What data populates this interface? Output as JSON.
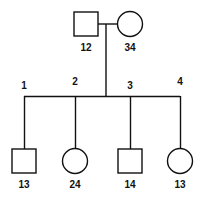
{
  "diagram": {
    "type": "pedigree-chart",
    "title": "",
    "background_color": "#ffffff",
    "line_color": "#111111",
    "shape_fill": "#ffffff",
    "label_color": "#111111"
  },
  "generations": [
    {
      "name": "parents",
      "members": [
        {
          "id": "father",
          "symbol": "square",
          "sex": "male",
          "label": "12",
          "cx": 86,
          "cy": 24,
          "size": 24
        },
        {
          "id": "mother",
          "symbol": "circle",
          "sex": "female",
          "label": "34",
          "cx": 130,
          "cy": 24,
          "size": 24
        }
      ]
    },
    {
      "name": "children",
      "members": [
        {
          "id": "child-1",
          "symbol": "square",
          "sex": "male",
          "label": "13",
          "sib_index": "1",
          "cx": 24,
          "cy": 161,
          "size": 24
        },
        {
          "id": "child-2",
          "symbol": "circle",
          "sex": "female",
          "label": "24",
          "sib_index": "2",
          "cx": 75,
          "cy": 161,
          "size": 24
        },
        {
          "id": "child-3",
          "symbol": "square",
          "sex": "male",
          "label": "14",
          "sib_index": "3",
          "cx": 130,
          "cy": 161,
          "size": 24
        },
        {
          "id": "child-4",
          "symbol": "circle",
          "sex": "female",
          "label": "13",
          "sib_index": "4",
          "cx": 180,
          "cy": 161,
          "size": 24
        }
      ]
    }
  ],
  "sibship_indices": [
    {
      "label": "1",
      "x": 24,
      "y": 89
    },
    {
      "label": "2",
      "x": 75,
      "y": 85
    },
    {
      "label": "3",
      "x": 130,
      "y": 89
    },
    {
      "label": "4",
      "x": 180,
      "y": 85
    }
  ],
  "connectors": {
    "mating_line": {
      "x1": 98,
      "y1": 24,
      "x2": 118,
      "y2": 24
    },
    "descent_line": {
      "x1": 106,
      "y1": 24,
      "x2": 106,
      "y2": 96
    },
    "sibship_line": {
      "x1": 24,
      "y1": 96,
      "x2": 180,
      "y2": 96
    },
    "child_drops": [
      {
        "x": 24,
        "y1": 96,
        "y2": 149
      },
      {
        "x": 75,
        "y1": 96,
        "y2": 149
      },
      {
        "x": 130,
        "y1": 96,
        "y2": 149
      },
      {
        "x": 180,
        "y1": 96,
        "y2": 149
      }
    ]
  }
}
